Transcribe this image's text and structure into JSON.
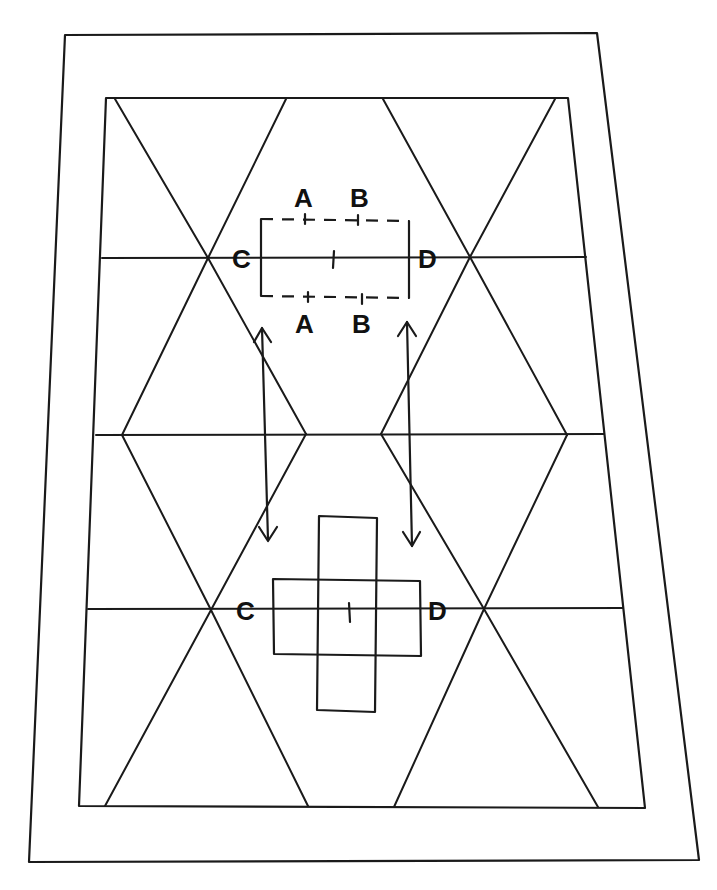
{
  "diagram": {
    "colors": {
      "ink": "#1a1a1a",
      "background": "#ffffff"
    },
    "top_formation": {
      "labels_top": [
        "A",
        "B"
      ],
      "labels_bottom": [
        "A",
        "B"
      ],
      "left_label": "C",
      "right_label": "D",
      "center_mark": "I",
      "shape": "rectangle with dashed top and bottom edges"
    },
    "bottom_formation": {
      "left_label": "C",
      "right_label": "D",
      "center_mark": "I",
      "shape": "cross of two overlapping rectangles"
    },
    "arrows": [
      {
        "name": "left-double-arrow",
        "type": "double-headed vertical"
      },
      {
        "name": "right-double-arrow",
        "type": "double-headed vertical"
      }
    ]
  }
}
